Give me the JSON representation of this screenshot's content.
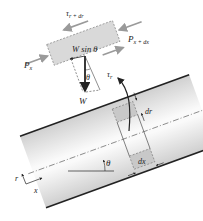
{
  "diagram": {
    "element_labels": {
      "shear_top": "τ",
      "shear_top_sub": "r + dr",
      "pressure_left": "P",
      "pressure_left_sub": "x",
      "pressure_right": "P",
      "pressure_right_sub": "x + dx",
      "weight_component": "W sin θ",
      "shear_bottom": "τ",
      "shear_bottom_sub": "r",
      "angle": "θ",
      "weight": "W"
    },
    "pipe_labels": {
      "dr": "dr",
      "dx": "dx",
      "angle": "θ",
      "axis_r": "r",
      "axis_x": "x"
    },
    "colors": {
      "element_fill": "#d9d9d9",
      "arrow_gray": "#9a9a9a",
      "line_dark": "#222222",
      "pipe_gradient_dark": "#cfcfcf",
      "pipe_gradient_light": "#ffffff"
    },
    "inclination_deg": 20
  }
}
